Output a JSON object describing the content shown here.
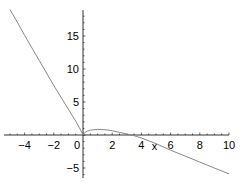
{
  "chart_data": {
    "type": "line",
    "title": "",
    "xlabel": "x",
    "ylabel": "",
    "xlim": [
      -5.2,
      10
    ],
    "ylim": [
      -6.5,
      19
    ],
    "grid": false,
    "legend": null,
    "x_ticks": [
      -4,
      -2,
      0,
      2,
      4,
      6,
      8,
      10
    ],
    "y_ticks": [
      -5,
      5,
      10,
      15
    ],
    "x_tick_labels": [
      "−4",
      "−2",
      "0",
      "2",
      "4",
      "6",
      "8",
      "10"
    ],
    "y_tick_labels": [
      "−5",
      "5",
      "10",
      "15"
    ],
    "series": [
      {
        "name": "f(x)",
        "color": "#888888",
        "x": [
          -5,
          -4.5,
          -4,
          -3.5,
          -3,
          -2.5,
          -2,
          -1.5,
          -1,
          -0.5,
          -0.2,
          0,
          0.1,
          0.3,
          0.5,
          1,
          1.5,
          2,
          2.5,
          3,
          3.5,
          4,
          5,
          6,
          7,
          8,
          9,
          10
        ],
        "y": [
          19,
          17.1,
          15.1,
          13.2,
          11.3,
          9.4,
          7.5,
          5.7,
          3.9,
          2.1,
          0.9,
          0,
          0.35,
          0.6,
          0.75,
          0.85,
          0.8,
          0.65,
          0.4,
          0.15,
          -0.1,
          -0.45,
          -1.3,
          -2.3,
          -3.2,
          -4.1,
          -5.0,
          -5.9
        ]
      }
    ]
  }
}
